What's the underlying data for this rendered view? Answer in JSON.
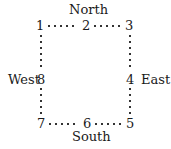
{
  "directions": {
    "north": "North",
    "south": "South",
    "east": "East",
    "west": "West"
  },
  "positions": {
    "p1": "1",
    "p2": "2",
    "p3": "3",
    "p4": "4",
    "p5": "5",
    "p6": "6",
    "p7": "7",
    "p8": "8"
  }
}
